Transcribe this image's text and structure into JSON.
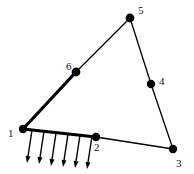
{
  "figure": {
    "type": "truss-diagram",
    "title": "",
    "background_color": "#ffffff",
    "line_color": "#000000",
    "node_color": "#000000",
    "label_color": "#111111",
    "canvas": {
      "width": 194,
      "height": 174
    }
  },
  "nodes": [
    {
      "id": "1",
      "label": "1",
      "x": 23,
      "y": 129,
      "r": 4.2,
      "label_x": 8,
      "label_y": 137
    },
    {
      "id": "2",
      "label": "2",
      "x": 96,
      "y": 137,
      "r": 4.2,
      "label_x": 94,
      "label_y": 151
    },
    {
      "id": "3",
      "label": "3",
      "x": 173,
      "y": 149,
      "r": 4.2,
      "label_x": 176,
      "label_y": 167
    },
    {
      "id": "4",
      "label": "4",
      "x": 151,
      "y": 84,
      "r": 4.2,
      "label_x": 159,
      "label_y": 85
    },
    {
      "id": "5",
      "label": "5",
      "x": 130,
      "y": 18,
      "r": 4.4,
      "label_x": 138,
      "label_y": 14
    },
    {
      "id": "6",
      "label": "6",
      "x": 76,
      "y": 72,
      "r": 4.4,
      "label_x": 66,
      "label_y": 70
    }
  ],
  "members": [
    {
      "id": "m-1-6",
      "from": "1",
      "to": "6",
      "width": 3.2,
      "emphasis": "bold"
    },
    {
      "id": "m-6-5",
      "from": "6",
      "to": "5",
      "width": 1.3,
      "emphasis": "normal"
    },
    {
      "id": "m-5-4",
      "from": "5",
      "to": "4",
      "width": 1.3,
      "emphasis": "normal"
    },
    {
      "id": "m-4-3",
      "from": "4",
      "to": "3",
      "width": 1.3,
      "emphasis": "normal"
    },
    {
      "id": "m-1-2",
      "from": "1",
      "to": "2",
      "width": 3.2,
      "emphasis": "bold"
    },
    {
      "id": "m-2-3",
      "from": "2",
      "to": "3",
      "width": 1.3,
      "emphasis": "normal"
    }
  ],
  "load_arrows": {
    "count": 6,
    "direction": "downward",
    "slant_dx": -5,
    "length": 33,
    "head_length": 7,
    "head_width": 5,
    "stroke_width": 1.4,
    "origins": [
      {
        "x": 32,
        "y": 130
      },
      {
        "x": 44,
        "y": 131
      },
      {
        "x": 56,
        "y": 133
      },
      {
        "x": 68,
        "y": 134
      },
      {
        "x": 80,
        "y": 135
      },
      {
        "x": 92,
        "y": 136
      }
    ]
  }
}
